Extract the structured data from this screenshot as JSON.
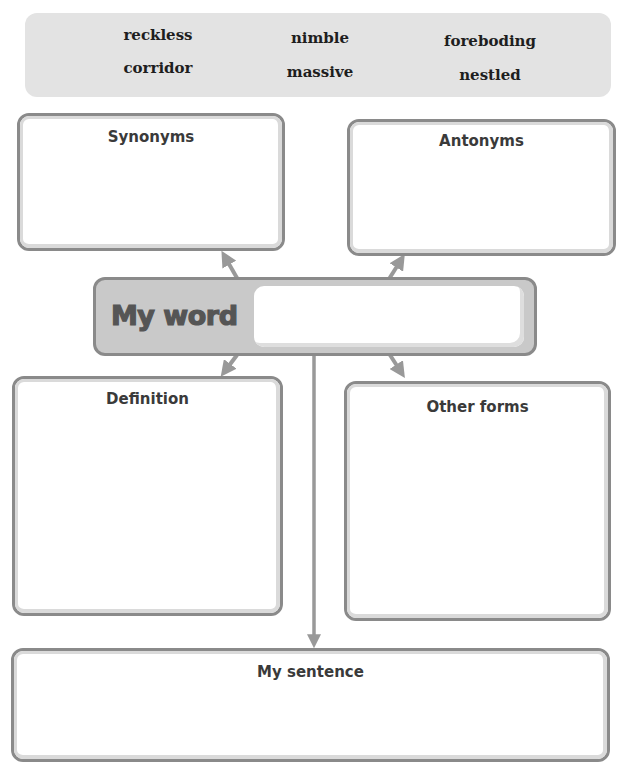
{
  "word_bank": {
    "words": [
      {
        "text": "reckless",
        "row": 1,
        "col": 1
      },
      {
        "text": "nimble",
        "row": 1,
        "col": 2
      },
      {
        "text": "foreboding",
        "row": 1,
        "col": 3
      },
      {
        "text": "corridor",
        "row": 2,
        "col": 1
      },
      {
        "text": "massive",
        "row": 2,
        "col": 2
      },
      {
        "text": "nestled",
        "row": 2,
        "col": 3
      }
    ]
  },
  "organizer": {
    "center": {
      "label": "My word",
      "value": ""
    },
    "boxes": {
      "synonyms": {
        "title": "Synonyms",
        "value": ""
      },
      "antonyms": {
        "title": "Antonyms",
        "value": ""
      },
      "definition": {
        "title": "Definition",
        "value": ""
      },
      "other_forms": {
        "title": "Other forms",
        "value": ""
      },
      "sentence": {
        "title": "My sentence",
        "value": ""
      }
    }
  },
  "colors": {
    "word_bank_bg": "#e3e3e3",
    "border_dark": "#8a8a8a",
    "border_light": "#dadada",
    "center_fill": "#c9c9c9",
    "connector": "#999999",
    "title_text": "#3a3a3a"
  }
}
